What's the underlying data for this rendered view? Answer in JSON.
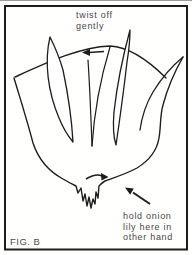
{
  "panel": {
    "figure_label": "FIG. B",
    "annotations": {
      "twist_instruction": "twist off\ngently",
      "hold_instruction": "hold onion\nlily here in\nother hand"
    },
    "arrows": [
      {
        "name": "twist-direction-arrow",
        "direction": "left"
      },
      {
        "name": "base-rotation-arrow",
        "direction": "right"
      },
      {
        "name": "hold-location-arrow",
        "direction": "up-left"
      }
    ],
    "colors": {
      "line": "#1d1d1d",
      "text": "#474747",
      "frame": "#1d1d1d",
      "background": "#ffffff"
    }
  }
}
